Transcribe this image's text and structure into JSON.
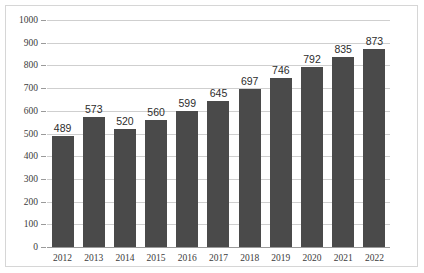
{
  "chart_data": {
    "type": "bar",
    "title": "",
    "subtitle": "",
    "xlabel": "",
    "ylabel": "",
    "categories": [
      "2012",
      "2013",
      "2014",
      "2015",
      "2016",
      "2017",
      "2018",
      "2019",
      "2020",
      "2021",
      "2022"
    ],
    "values": [
      489,
      573,
      520,
      560,
      599,
      645,
      697,
      746,
      792,
      835,
      873
    ],
    "data_labels": [
      "489",
      "573",
      "520",
      "560",
      "599",
      "645",
      "697",
      "746",
      "792",
      "835",
      "873"
    ],
    "ylim": [
      0,
      1000
    ],
    "ytick_values": [
      0,
      100,
      200,
      300,
      400,
      500,
      600,
      700,
      800,
      900,
      1000
    ],
    "ytick_labels": [
      "0",
      "100",
      "200",
      "300",
      "400",
      "500",
      "600",
      "700",
      "800",
      "900",
      "1000"
    ],
    "grid": true,
    "grid_axis": "y",
    "legend": false,
    "legend_position": "none",
    "series": [
      {
        "name": "",
        "values": [
          489,
          573,
          520,
          560,
          599,
          645,
          697,
          746,
          792,
          835,
          873
        ],
        "color": "#4a4a4a"
      }
    ]
  },
  "style": {
    "bar_color": "#4a4a4a",
    "grid_color": "#cfcfcf",
    "axis_color": "#9a9a9a",
    "frame_color": "#d6d6d6",
    "background": "#ffffff",
    "text_color": "#3b3b3b",
    "label_color": "#2d2d2d"
  }
}
